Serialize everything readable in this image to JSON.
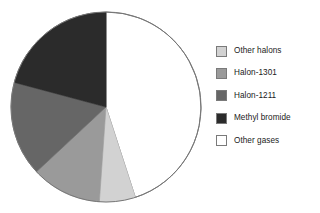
{
  "chart_data": {
    "type": "pie",
    "title": "",
    "legend_position": "right",
    "categories": [
      "Other halons",
      "Halon-1301",
      "Halon-1211",
      "Methyl bromide",
      "Other gases"
    ],
    "values": [
      6,
      12,
      16,
      21,
      45
    ],
    "unit": "percent",
    "colors": [
      "#d2d2d2",
      "#9a9a9a",
      "#666666",
      "#2b2b2b",
      "#ffffff"
    ],
    "slice_order_clockwise_from_top": [
      "Other gases",
      "Other halons",
      "Halon-1301",
      "Halon-1211",
      "Methyl bromide"
    ],
    "slices": [
      {
        "label": "Other gases",
        "value": 45,
        "color": "#ffffff",
        "start_angle": 0,
        "end_angle": 162
      },
      {
        "label": "Other halons",
        "value": 6,
        "color": "#d2d2d2",
        "start_angle": 162,
        "end_angle": 184
      },
      {
        "label": "Halon-1301",
        "value": 12,
        "color": "#9a9a9a",
        "start_angle": 184,
        "end_angle": 227
      },
      {
        "label": "Halon-1211",
        "value": 16,
        "color": "#666666",
        "start_angle": 227,
        "end_angle": 285
      },
      {
        "label": "Methyl bromide",
        "value": 21,
        "color": "#2b2b2b",
        "start_angle": 285,
        "end_angle": 360
      }
    ],
    "geometry": {
      "cx": 106,
      "cy": 107,
      "r": 95
    },
    "outline_color": "#777777"
  },
  "legend": {
    "items": [
      {
        "label": "Other halons",
        "color": "#d2d2d2"
      },
      {
        "label": "Halon-1301",
        "color": "#9a9a9a"
      },
      {
        "label": "Halon-1211",
        "color": "#666666"
      },
      {
        "label": "Methyl bromide",
        "color": "#2b2b2b"
      },
      {
        "label": "Other gases",
        "color": "#ffffff"
      }
    ]
  }
}
